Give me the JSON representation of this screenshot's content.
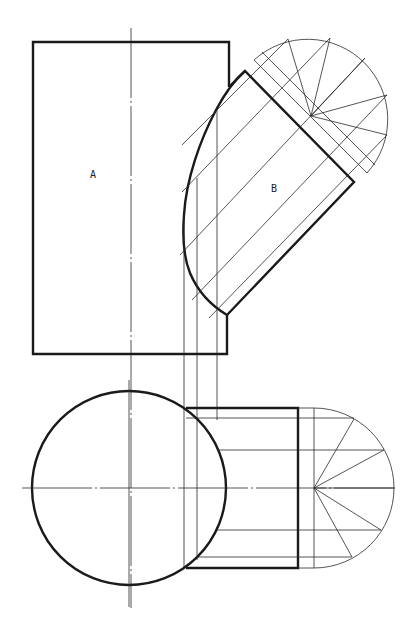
{
  "drawing": {
    "type": "orthographic-projection",
    "description": "Intersection of cylinder B (inclined) with cylinder A (vertical) — front view and top view with construction lines",
    "labels": {
      "part_a": "A",
      "part_b": "B"
    },
    "colors": {
      "line": "#1a1a1a",
      "background": "#ffffff"
    },
    "front_view": {
      "cylinder_a_rect": {
        "x": 33,
        "y": 42,
        "right": 228,
        "bottom": 354
      },
      "cylinder_a_axis_x": 131,
      "cylinder_b_corner_top": [
        245,
        71
      ],
      "cylinder_b_corner_right": [
        354,
        182
      ],
      "cylinder_b_corner_bottom": [
        227,
        315
      ],
      "aux_semicircle_center": [
        311,
        116
      ],
      "aux_semicircle_radius": 80,
      "projection_lines_x": [
        184,
        197,
        217
      ]
    },
    "top_view": {
      "cylinder_a_circle_center": [
        129,
        488
      ],
      "cylinder_a_circle_radius": 97,
      "cylinder_b_rect": {
        "left": 186,
        "top": 408,
        "right": 298,
        "bottom": 568
      },
      "aux_semicircle_center": [
        314,
        488
      ],
      "aux_semicircle_radius": 80,
      "generator_lines_y": [
        418,
        450,
        488,
        530,
        557
      ]
    }
  }
}
